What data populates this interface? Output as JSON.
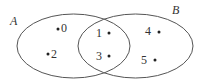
{
  "diagram": {
    "type": "venn",
    "sets": [
      {
        "name": "A",
        "elements": [
          "0",
          "2",
          "1",
          "3"
        ],
        "color": "#555555"
      },
      {
        "name": "B",
        "elements": [
          "1",
          "3",
          "4",
          "5"
        ],
        "color": "#555555"
      }
    ],
    "intersection": [
      "1",
      "3"
    ],
    "points": [
      {
        "label": "0",
        "region": "A only"
      },
      {
        "label": "2",
        "region": "A only"
      },
      {
        "label": "1",
        "region": "A and B"
      },
      {
        "label": "3",
        "region": "A and B"
      },
      {
        "label": "4",
        "region": "B only"
      },
      {
        "label": "5",
        "region": "B only"
      }
    ]
  }
}
